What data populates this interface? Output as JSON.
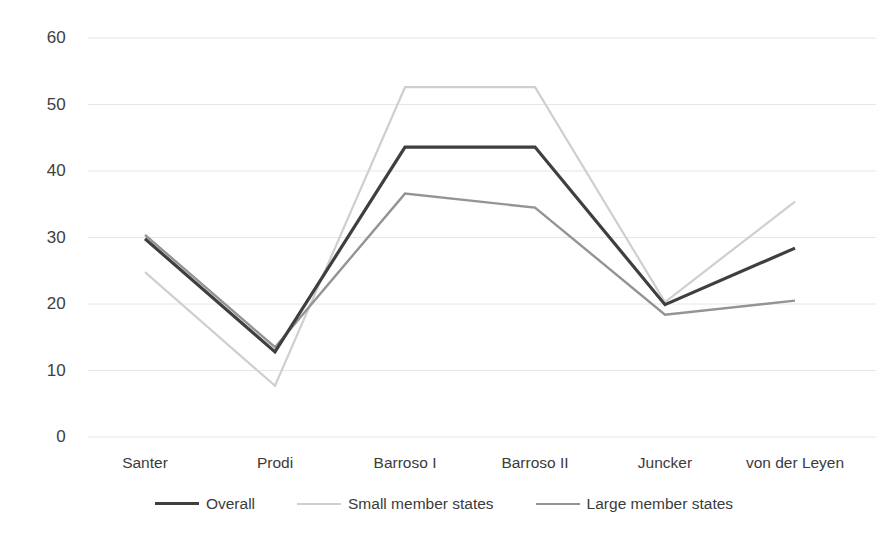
{
  "chart_data": {
    "type": "line",
    "title": "",
    "subtitle": "",
    "xlabel": "",
    "ylabel": "",
    "categories": [
      "Santer",
      "Prodi",
      "Barroso I",
      "Barroso II",
      "Juncker",
      "von der Leyen"
    ],
    "series": [
      {
        "name": "Overall",
        "color": "#3f3f3f",
        "width": 3.2,
        "values": [
          29.8,
          12.8,
          43.6,
          43.6,
          19.9,
          28.4
        ]
      },
      {
        "name": "Small member states",
        "color": "#cfcfcf",
        "width": 2.2,
        "values": [
          24.8,
          7.7,
          52.6,
          52.6,
          20.3,
          35.4
        ]
      },
      {
        "name": "Large member states",
        "color": "#949494",
        "width": 2.4,
        "values": [
          30.4,
          13.5,
          36.6,
          34.5,
          18.4,
          20.5
        ]
      }
    ],
    "ylim": [
      0,
      60
    ],
    "yticks": [
      0,
      10,
      20,
      30,
      40,
      50,
      60
    ],
    "ytick_labels": [
      "0",
      "10",
      "20",
      "30",
      "40",
      "50",
      "60"
    ],
    "grid": true,
    "grid_color": "#e6e6e6",
    "legend_position": "bottom",
    "background": "#ffffff"
  },
  "legend": {
    "items": [
      {
        "label": "Overall"
      },
      {
        "label": "Small member states"
      },
      {
        "label": "Large member states"
      }
    ]
  }
}
